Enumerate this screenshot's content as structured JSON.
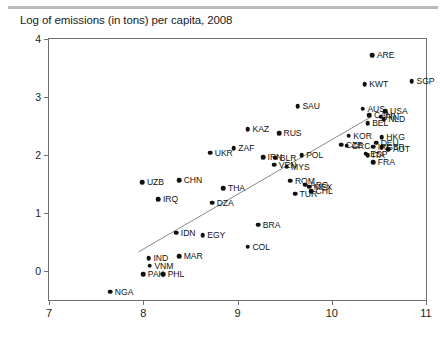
{
  "chart_data": {
    "type": "scatter",
    "title": "Log of emissions (in tons) per capita, 2008",
    "xlabel": "",
    "ylabel": "",
    "xlim": [
      7,
      11
    ],
    "ylim": [
      -0.5,
      4
    ],
    "xticks": [
      7,
      8,
      9,
      10,
      11
    ],
    "yticks": [
      0,
      1,
      2,
      3,
      4
    ],
    "grid": false,
    "legend": "none",
    "marker_color": "#111111",
    "fit_line": {
      "label": "regression line",
      "x": [
        7.95,
        10.42
      ],
      "y": [
        0.33,
        2.66
      ],
      "color": "#8a8a8a"
    },
    "points": [
      {
        "label": "ARE",
        "x": 10.43,
        "y": 3.72,
        "label_pos": "right"
      },
      {
        "label": "KWT",
        "x": 10.35,
        "y": 3.22,
        "label_pos": "right"
      },
      {
        "label": "SGP",
        "x": 10.85,
        "y": 3.27,
        "label_pos": "right"
      },
      {
        "label": "SAU",
        "x": 9.64,
        "y": 2.84,
        "label_pos": "right"
      },
      {
        "label": "AUS",
        "x": 10.33,
        "y": 2.8,
        "label_pos": "right"
      },
      {
        "label": "USA",
        "x": 10.57,
        "y": 2.76,
        "label_pos": "right"
      },
      {
        "label": "CAN",
        "x": 10.4,
        "y": 2.69,
        "label_pos": "right"
      },
      {
        "label": "NLD",
        "x": 10.55,
        "y": 2.62,
        "label_pos": "right"
      },
      {
        "label": "BEL",
        "x": 10.38,
        "y": 2.55,
        "label_pos": "right"
      },
      {
        "label": "FIN",
        "x": 10.52,
        "y": 2.66,
        "label_pos": "right"
      },
      {
        "label": "HKG",
        "x": 10.53,
        "y": 2.31,
        "label_pos": "right"
      },
      {
        "label": "KOR",
        "x": 10.18,
        "y": 2.33,
        "label_pos": "right"
      },
      {
        "label": "KAZ",
        "x": 9.11,
        "y": 2.44,
        "label_pos": "right"
      },
      {
        "label": "RUS",
        "x": 9.44,
        "y": 2.38,
        "label_pos": "right"
      },
      {
        "label": "DEU",
        "x": 10.47,
        "y": 2.21,
        "label_pos": "right"
      },
      {
        "label": "GBR",
        "x": 10.53,
        "y": 2.13,
        "label_pos": "right"
      },
      {
        "label": "AUT",
        "x": 10.6,
        "y": 2.1,
        "label_pos": "right"
      },
      {
        "label": "CZE",
        "x": 10.1,
        "y": 2.18,
        "label_pos": "right"
      },
      {
        "label": "GRC",
        "x": 10.16,
        "y": 2.16,
        "label_pos": "right"
      },
      {
        "label": "IRL",
        "x": 10.44,
        "y": 2.14,
        "label_pos": "right"
      },
      {
        "label": "ESP",
        "x": 10.36,
        "y": 2.02,
        "label_pos": "right"
      },
      {
        "label": "ITA",
        "x": 10.38,
        "y": 2.0,
        "label_pos": "right"
      },
      {
        "label": "FRA",
        "x": 10.44,
        "y": 1.88,
        "label_pos": "right"
      },
      {
        "label": "ZAF",
        "x": 8.96,
        "y": 2.12,
        "label_pos": "right"
      },
      {
        "label": "UKR",
        "x": 8.71,
        "y": 2.04,
        "label_pos": "right"
      },
      {
        "label": "POL",
        "x": 9.68,
        "y": 2.0,
        "label_pos": "right"
      },
      {
        "label": "IRN",
        "x": 9.27,
        "y": 1.96,
        "label_pos": "right"
      },
      {
        "label": "BLR",
        "x": 9.4,
        "y": 1.95,
        "label_pos": "right"
      },
      {
        "label": "VEN",
        "x": 9.39,
        "y": 1.83,
        "label_pos": "right"
      },
      {
        "label": "MYS",
        "x": 9.52,
        "y": 1.8,
        "label_pos": "right"
      },
      {
        "label": "ROM",
        "x": 9.56,
        "y": 1.56,
        "label_pos": "right"
      },
      {
        "label": "ARG",
        "x": 9.72,
        "y": 1.49,
        "label_pos": "right"
      },
      {
        "label": "MEX",
        "x": 9.76,
        "y": 1.45,
        "label_pos": "right"
      },
      {
        "label": "CHL",
        "x": 9.78,
        "y": 1.38,
        "label_pos": "right"
      },
      {
        "label": "TUR",
        "x": 9.61,
        "y": 1.33,
        "label_pos": "right"
      },
      {
        "label": "CHN",
        "x": 8.38,
        "y": 1.57,
        "label_pos": "right"
      },
      {
        "label": "THA",
        "x": 8.85,
        "y": 1.43,
        "label_pos": "right"
      },
      {
        "label": "UZB",
        "x": 7.99,
        "y": 1.53,
        "label_pos": "right"
      },
      {
        "label": "IRQ",
        "x": 8.16,
        "y": 1.24,
        "label_pos": "right"
      },
      {
        "label": "DZA",
        "x": 8.73,
        "y": 1.18,
        "label_pos": "right"
      },
      {
        "label": "BRA",
        "x": 9.22,
        "y": 0.8,
        "label_pos": "right"
      },
      {
        "label": "IDN",
        "x": 8.35,
        "y": 0.66,
        "label_pos": "right"
      },
      {
        "label": "EGY",
        "x": 8.63,
        "y": 0.62,
        "label_pos": "right"
      },
      {
        "label": "COL",
        "x": 9.11,
        "y": 0.42,
        "label_pos": "right"
      },
      {
        "label": "IND",
        "x": 8.06,
        "y": 0.22,
        "label_pos": "right"
      },
      {
        "label": "MAR",
        "x": 8.38,
        "y": 0.26,
        "label_pos": "right"
      },
      {
        "label": "VNM",
        "x": 8.07,
        "y": 0.09,
        "label_pos": "right"
      },
      {
        "label": "PAK",
        "x": 8.0,
        "y": -0.06,
        "label_pos": "right"
      },
      {
        "label": "PHL",
        "x": 8.21,
        "y": -0.06,
        "label_pos": "right"
      },
      {
        "label": "NGA",
        "x": 7.65,
        "y": -0.36,
        "label_pos": "right"
      }
    ]
  }
}
